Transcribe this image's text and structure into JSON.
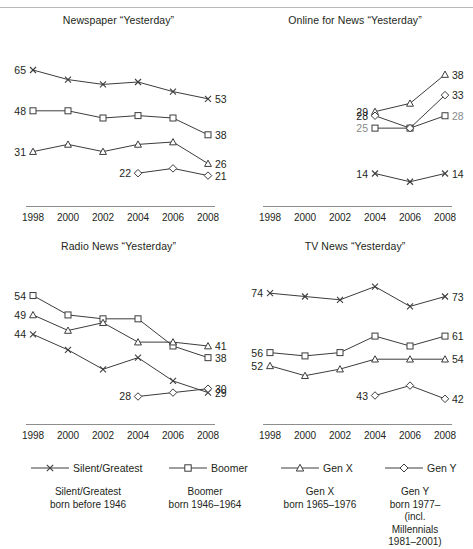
{
  "figure": {
    "background": "#ffffff",
    "line_color": "#3c3c3c",
    "axis_color": "#8d8d8d",
    "text_color": "#231f20",
    "muted_text_color": "#8a8a8a"
  },
  "legend": {
    "items": [
      {
        "label": "Silent/Greatest",
        "marker": "x-marker-icon"
      },
      {
        "label": "Boomer",
        "marker": "square-marker-icon"
      },
      {
        "label": "Gen X",
        "marker": "triangle-marker-icon"
      },
      {
        "label": "Gen Y",
        "marker": "diamond-marker-icon"
      }
    ]
  },
  "footnotes": [
    {
      "lines": [
        "Silent/Greatest",
        "born before 1946"
      ]
    },
    {
      "lines": [
        "Boomer",
        "born 1946–1964"
      ]
    },
    {
      "lines": [
        "Gen X",
        "born 1965–1976"
      ]
    },
    {
      "lines": [
        "Gen Y",
        "born 1977–",
        "(incl. Millennials",
        "1981–2001)"
      ]
    }
  ],
  "chart_data": [
    {
      "type": "line",
      "title": "Newspaper “Yesterday”",
      "xlabel": "",
      "ylabel": "",
      "x": [
        1998,
        2000,
        2002,
        2004,
        2006,
        2008
      ],
      "xtick_labels": [
        "1998",
        "2000",
        "2002",
        "2004",
        "2006",
        "2008"
      ],
      "ylim": [
        15,
        70
      ],
      "grid": false,
      "legend_position": "bottom",
      "series": [
        {
          "name": "Silent/Greatest",
          "marker": "x-marker-icon",
          "x": [
            1998,
            2000,
            2002,
            2004,
            2006,
            2008
          ],
          "values": [
            65,
            61,
            59,
            60,
            56,
            53
          ],
          "start_label": "65",
          "end_label": "53"
        },
        {
          "name": "Boomer",
          "marker": "square-marker-icon",
          "x": [
            1998,
            2000,
            2002,
            2004,
            2006,
            2008
          ],
          "values": [
            48,
            48,
            45,
            46,
            45,
            38
          ],
          "start_label": "48",
          "end_label": "38"
        },
        {
          "name": "Gen X",
          "marker": "triangle-marker-icon",
          "x": [
            1998,
            2000,
            2002,
            2004,
            2006,
            2008
          ],
          "values": [
            31,
            34,
            31,
            34,
            35,
            26
          ],
          "start_label": "31",
          "end_label": "26"
        },
        {
          "name": "Gen Y",
          "marker": "diamond-marker-icon",
          "x": [
            2004,
            2006,
            2008
          ],
          "values": [
            22,
            24,
            21
          ],
          "start_label": "22",
          "end_label": "21"
        }
      ]
    },
    {
      "type": "line",
      "title": "Online for News “Yesterday”",
      "xlabel": "",
      "ylabel": "",
      "x": [
        1998,
        2000,
        2002,
        2004,
        2006,
        2008
      ],
      "xtick_labels": [
        "1998",
        "2000",
        "2002",
        "2004",
        "2006",
        "2008"
      ],
      "ylim": [
        10,
        42
      ],
      "grid": false,
      "legend_position": "bottom",
      "series": [
        {
          "name": "Silent/Greatest",
          "marker": "x-marker-icon",
          "x": [
            2004,
            2006,
            2008
          ],
          "values": [
            14,
            12,
            14
          ],
          "start_label": "14",
          "end_label": "14"
        },
        {
          "name": "Boomer",
          "marker": "square-marker-icon",
          "x": [
            2004,
            2006,
            2008
          ],
          "values": [
            25,
            25,
            28
          ],
          "start_label": "25",
          "end_label": "28"
        },
        {
          "name": "Gen X",
          "marker": "triangle-marker-icon",
          "x": [
            2004,
            2006,
            2008
          ],
          "values": [
            29,
            31,
            38
          ],
          "start_label": "29",
          "end_label": "38"
        },
        {
          "name": "Gen Y",
          "marker": "diamond-marker-icon",
          "x": [
            2004,
            2006,
            2008
          ],
          "values": [
            28,
            25,
            33
          ],
          "start_label": "28",
          "end_label": "33"
        }
      ]
    },
    {
      "type": "line",
      "title": "Radio News “Yesterday”",
      "xlabel": "",
      "ylabel": "",
      "x": [
        1998,
        2000,
        2002,
        2004,
        2006,
        2008
      ],
      "xtick_labels": [
        "1998",
        "2000",
        "2002",
        "2004",
        "2006",
        "2008"
      ],
      "ylim": [
        24,
        58
      ],
      "grid": false,
      "legend_position": "bottom",
      "series": [
        {
          "name": "Silent/Greatest",
          "marker": "x-marker-icon",
          "x": [
            1998,
            2000,
            2002,
            2004,
            2006,
            2008
          ],
          "values": [
            44,
            40,
            35,
            38,
            32,
            29
          ],
          "start_label": "44",
          "end_label": "29"
        },
        {
          "name": "Boomer",
          "marker": "square-marker-icon",
          "x": [
            1998,
            2000,
            2002,
            2004,
            2006,
            2008
          ],
          "values": [
            54,
            49,
            48,
            48,
            41,
            38
          ],
          "start_label": "54",
          "end_label": "38"
        },
        {
          "name": "Gen X",
          "marker": "triangle-marker-icon",
          "x": [
            1998,
            2000,
            2002,
            2004,
            2006,
            2008
          ],
          "values": [
            49,
            45,
            47,
            42,
            42,
            41
          ],
          "start_label": "49",
          "end_label": "41"
        },
        {
          "name": "Gen Y",
          "marker": "diamond-marker-icon",
          "x": [
            2004,
            2006,
            2008
          ],
          "values": [
            28,
            29,
            30
          ],
          "start_label": "28",
          "end_label": "30"
        }
      ]
    },
    {
      "type": "line",
      "title": "TV News “Yesterday”",
      "xlabel": "",
      "ylabel": "",
      "x": [
        1998,
        2000,
        2002,
        2004,
        2006,
        2008
      ],
      "xtick_labels": [
        "1998",
        "2000",
        "2002",
        "2004",
        "2006",
        "2008"
      ],
      "ylim": [
        38,
        78
      ],
      "grid": false,
      "legend_position": "bottom",
      "series": [
        {
          "name": "Silent/Greatest",
          "marker": "x-marker-icon",
          "x": [
            1998,
            2000,
            2002,
            2004,
            2006,
            2008
          ],
          "values": [
            74,
            73,
            72,
            76,
            70,
            73
          ],
          "start_label": "74",
          "end_label": "73"
        },
        {
          "name": "Boomer",
          "marker": "square-marker-icon",
          "x": [
            1998,
            2000,
            2002,
            2004,
            2006,
            2008
          ],
          "values": [
            56,
            55,
            56,
            61,
            58,
            61
          ],
          "start_label": "56",
          "end_label": "61"
        },
        {
          "name": "Gen X",
          "marker": "triangle-marker-icon",
          "x": [
            1998,
            2000,
            2002,
            2004,
            2006,
            2008
          ],
          "values": [
            52,
            49,
            51,
            54,
            54,
            54
          ],
          "start_label": "52",
          "end_label": "54"
        },
        {
          "name": "Gen Y",
          "marker": "diamond-marker-icon",
          "x": [
            2004,
            2006,
            2008
          ],
          "values": [
            43,
            46,
            42
          ],
          "start_label": "43",
          "end_label": "42"
        }
      ]
    }
  ]
}
